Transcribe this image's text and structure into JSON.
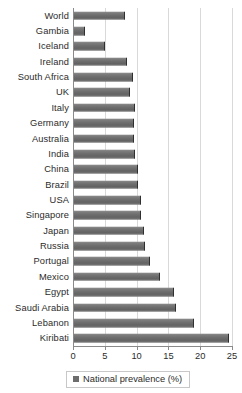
{
  "chart_data": {
    "type": "bar",
    "orientation": "horizontal",
    "title": "",
    "xlabel": "",
    "ylabel": "",
    "xlim": [
      0,
      25
    ],
    "xticks": [
      0,
      5,
      10,
      15,
      20,
      25
    ],
    "xtick_labels": [
      "0",
      "5",
      "10",
      "15",
      "20",
      "25"
    ],
    "grid": true,
    "legend": {
      "position": "bottom",
      "entries": [
        {
          "label": "National prevalence (%)",
          "color": "#6d6d6d"
        }
      ]
    },
    "series_name": "National prevalence (%)",
    "bar_color": "#6d6d6d",
    "categories": [
      "World",
      "Gambia",
      "Iceland",
      "Ireland",
      "South Africa",
      "UK",
      "Italy",
      "Germany",
      "Australia",
      "India",
      "China",
      "Brazil",
      "USA",
      "Singapore",
      "Japan",
      "Russia",
      "Portugal",
      "Mexico",
      "Egypt",
      "Saudi Arabia",
      "Lebanon",
      "Kiribati"
    ],
    "values": [
      8.0,
      1.8,
      4.8,
      8.3,
      9.2,
      8.8,
      9.6,
      9.4,
      9.5,
      9.6,
      10.0,
      10.0,
      10.5,
      10.6,
      11.0,
      11.2,
      12.0,
      13.5,
      15.8,
      16.1,
      18.8,
      24.4
    ]
  }
}
